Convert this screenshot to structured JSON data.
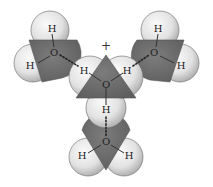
{
  "diagram": {
    "central_charge_label": "+",
    "colors": {
      "oxygen_region": "#6f6f6f",
      "hydrogen_light": "#f4f4f4",
      "hydrogen_dark": "#bdbdbd",
      "outline": "#5a5a5a"
    },
    "molecules": [
      {
        "id": "hydronium",
        "center_label": "O",
        "hydrogen_labels": [
          "H",
          "H",
          "H"
        ]
      },
      {
        "id": "water-left",
        "center_label": "O",
        "hydrogen_labels": [
          "H",
          "H"
        ]
      },
      {
        "id": "water-right",
        "center_label": "O",
        "hydrogen_labels": [
          "H",
          "H"
        ]
      },
      {
        "id": "water-bottom",
        "center_label": "O",
        "hydrogen_labels": [
          "H",
          "H"
        ]
      }
    ],
    "hydrogen_bonds": [
      "hydronium-H-left to water-left-O",
      "hydronium-H-right to water-right-O",
      "hydronium-H-bottom to water-bottom-O"
    ]
  }
}
